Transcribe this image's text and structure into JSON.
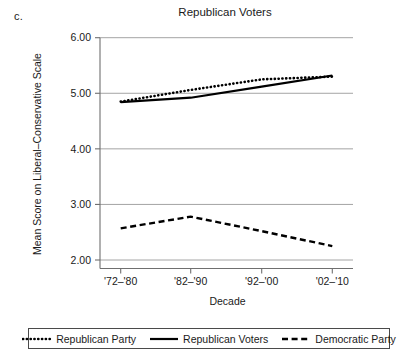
{
  "panel_label": "c.",
  "chart_data": {
    "type": "line",
    "title": "Republican Voters",
    "xlabel": "Decade",
    "ylabel": "Mean Score on Liberal–Conservative Scale",
    "categories": [
      "'72–'80",
      "'82–'90",
      "'92–'00",
      "'02–'10"
    ],
    "ylim": [
      2.0,
      6.0
    ],
    "yticks": [
      "2.00",
      "3.00",
      "4.00",
      "5.00",
      "6.00"
    ],
    "ytick_values": [
      2.0,
      3.0,
      4.0,
      5.0,
      6.0
    ],
    "grid": true,
    "legend_position": "bottom",
    "series": [
      {
        "name": "Republican Party",
        "style": "dotted",
        "color": "#000000",
        "values": [
          4.85,
          5.06,
          5.25,
          5.3
        ]
      },
      {
        "name": "Republican Voters",
        "style": "solid",
        "color": "#000000",
        "values": [
          4.84,
          4.92,
          5.12,
          5.32
        ]
      },
      {
        "name": "Democratic Party",
        "style": "dashed",
        "color": "#000000",
        "values": [
          2.57,
          2.78,
          2.52,
          2.25
        ]
      }
    ]
  }
}
